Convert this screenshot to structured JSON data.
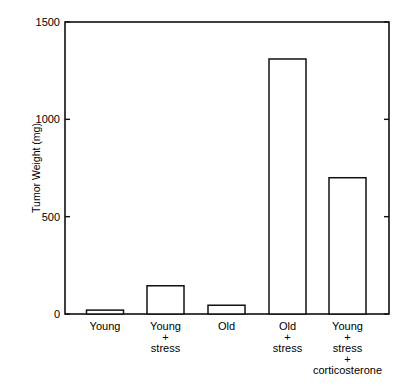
{
  "chart_data": {
    "type": "bar",
    "title": "",
    "xlabel": "",
    "ylabel": "Tumor Weight (mg)",
    "ylim": [
      0,
      1500
    ],
    "yticks": [
      0,
      500,
      1000,
      1500
    ],
    "grid": false,
    "legend": null,
    "categories": [
      [
        "Young"
      ],
      [
        "Young",
        "+",
        "stress"
      ],
      [
        "Old"
      ],
      [
        "Old",
        "+",
        "stress"
      ],
      [
        "Young",
        "+",
        "stress",
        "+",
        "corticosterone"
      ]
    ],
    "category_names": [
      "Young",
      "Young + stress",
      "Old",
      "Old + stress",
      "Young + stress + corticosterone"
    ],
    "values": [
      20,
      145,
      45,
      1310,
      700
    ]
  }
}
